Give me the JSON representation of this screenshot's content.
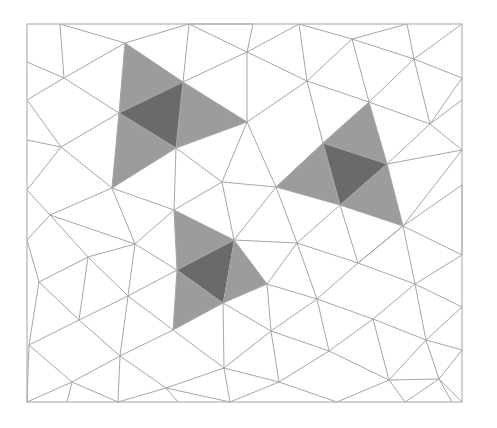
{
  "diagram": {
    "title": "",
    "type": "triangular-mesh",
    "colors": {
      "background": "#ffffff",
      "edge": "#a6a6a6",
      "frame": "#b3b3b3",
      "shade_light": "#9c9c9c",
      "shade_dark": "#6a6a6a"
    },
    "frame": {
      "x": 27,
      "y": 24,
      "w": 435,
      "h": 378
    },
    "vertices": {
      "A": [
        27,
        24
      ],
      "B": [
        60,
        24
      ],
      "C": [
        189,
        24
      ],
      "D": [
        253,
        24
      ],
      "E": [
        299,
        24
      ],
      "F": [
        407,
        24
      ],
      "G": [
        462,
        24
      ],
      "H": [
        27,
        62
      ],
      "I": [
        64,
        78
      ],
      "J": [
        125,
        43
      ],
      "K": [
        183,
        82
      ],
      "L": [
        247,
        52
      ],
      "M": [
        307,
        81
      ],
      "N": [
        352,
        39
      ],
      "O": [
        414,
        59
      ],
      "P": [
        462,
        78
      ],
      "Q": [
        27,
        100
      ],
      "R": [
        119,
        113
      ],
      "S": [
        247,
        122
      ],
      "T": [
        369,
        102
      ],
      "U": [
        430,
        124
      ],
      "V": [
        462,
        100
      ],
      "W": [
        27,
        140
      ],
      "X": [
        61,
        147
      ],
      "Y": [
        176,
        148
      ],
      "Z": [
        323,
        143
      ],
      "AA": [
        387,
        164
      ],
      "AB": [
        462,
        150
      ],
      "AC": [
        27,
        190
      ],
      "AD": [
        112,
        188
      ],
      "AE": [
        222,
        182
      ],
      "AF": [
        276,
        187
      ],
      "AG": [
        340,
        205
      ],
      "AH": [
        403,
        226
      ],
      "AI": [
        462,
        185
      ],
      "AJ": [
        50,
        215
      ],
      "AK": [
        174,
        210
      ],
      "AL": [
        234,
        240
      ],
      "AM": [
        297,
        243
      ],
      "AN": [
        358,
        263
      ],
      "AO": [
        462,
        255
      ],
      "AP": [
        27,
        240
      ],
      "AQ": [
        135,
        244
      ],
      "AR": [
        88,
        257
      ],
      "AS": [
        177,
        270
      ],
      "AT": [
        267,
        284
      ],
      "AU": [
        223,
        303
      ],
      "AV": [
        317,
        299
      ],
      "AW": [
        415,
        284
      ],
      "AX": [
        462,
        307
      ],
      "AY": [
        39,
        282
      ],
      "AZ": [
        128,
        296
      ],
      "BA": [
        79,
        320
      ],
      "BB": [
        173,
        330
      ],
      "BC": [
        271,
        331
      ],
      "BD": [
        373,
        319
      ],
      "BE": [
        426,
        340
      ],
      "BF": [
        29,
        345
      ],
      "BG": [
        120,
        356
      ],
      "BH": [
        224,
        368
      ],
      "BI": [
        329,
        351
      ],
      "BJ": [
        462,
        350
      ],
      "BK": [
        72,
        382
      ],
      "BL": [
        166,
        388
      ],
      "BM": [
        279,
        382
      ],
      "BN": [
        389,
        380
      ],
      "BO": [
        439,
        379
      ],
      "BP": [
        27,
        402
      ],
      "BQ": [
        67,
        402
      ],
      "BR": [
        118,
        402
      ],
      "BS": [
        178,
        402
      ],
      "BT": [
        230,
        402
      ],
      "BU": [
        337,
        402
      ],
      "BV": [
        405,
        402
      ],
      "BW": [
        452,
        402
      ],
      "BX": [
        462,
        402
      ]
    },
    "shaded_groups": [
      {
        "name": "cluster-top-left",
        "triangles": [
          {
            "pts": [
              "J",
              "K",
              "R"
            ],
            "shade": "light"
          },
          {
            "pts": [
              "K",
              "R",
              "Y"
            ],
            "shade": "dark"
          },
          {
            "pts": [
              "K",
              "S",
              "Y"
            ],
            "shade": "light"
          },
          {
            "pts": [
              "R",
              "Y",
              "AD"
            ],
            "shade": "light"
          }
        ]
      },
      {
        "name": "cluster-right",
        "triangles": [
          {
            "pts": [
              "T",
              "Z",
              "AA"
            ],
            "shade": "light"
          },
          {
            "pts": [
              "Z",
              "AA",
              "AG"
            ],
            "shade": "dark"
          },
          {
            "pts": [
              "Z",
              "AF",
              "AG"
            ],
            "shade": "light"
          },
          {
            "pts": [
              "AA",
              "AG",
              "AH"
            ],
            "shade": "light"
          }
        ]
      },
      {
        "name": "cluster-bottom",
        "triangles": [
          {
            "pts": [
              "AK",
              "AL",
              "AS"
            ],
            "shade": "light"
          },
          {
            "pts": [
              "AL",
              "AS",
              "AU"
            ],
            "shade": "dark"
          },
          {
            "pts": [
              "AL",
              "AT",
              "AU"
            ],
            "shade": "light"
          },
          {
            "pts": [
              "AS",
              "AU",
              "BB"
            ],
            "shade": "light"
          }
        ]
      }
    ],
    "edges": [
      [
        "B",
        "I"
      ],
      [
        "I",
        "J"
      ],
      [
        "J",
        "C"
      ],
      [
        "C",
        "K"
      ],
      [
        "B",
        "J"
      ],
      [
        "C",
        "L"
      ],
      [
        "C",
        "D"
      ],
      [
        "D",
        "L"
      ],
      [
        "L",
        "E"
      ],
      [
        "E",
        "N"
      ],
      [
        "N",
        "F"
      ],
      [
        "F",
        "O"
      ],
      [
        "O",
        "G"
      ],
      [
        "N",
        "O"
      ],
      [
        "H",
        "I"
      ],
      [
        "I",
        "Q"
      ],
      [
        "I",
        "R"
      ],
      [
        "J",
        "K"
      ],
      [
        "K",
        "L"
      ],
      [
        "K",
        "S"
      ],
      [
        "L",
        "S"
      ],
      [
        "L",
        "M"
      ],
      [
        "E",
        "M"
      ],
      [
        "M",
        "N"
      ],
      [
        "N",
        "T"
      ],
      [
        "O",
        "T"
      ],
      [
        "O",
        "U"
      ],
      [
        "O",
        "P"
      ],
      [
        "P",
        "U"
      ],
      [
        "Q",
        "X"
      ],
      [
        "R",
        "X"
      ],
      [
        "X",
        "W"
      ],
      [
        "R",
        "J"
      ],
      [
        "R",
        "K"
      ],
      [
        "R",
        "Y"
      ],
      [
        "K",
        "Y"
      ],
      [
        "S",
        "Y"
      ],
      [
        "S",
        "M"
      ],
      [
        "M",
        "T"
      ],
      [
        "M",
        "Z"
      ],
      [
        "T",
        "Z"
      ],
      [
        "T",
        "AA"
      ],
      [
        "T",
        "U"
      ],
      [
        "U",
        "AA"
      ],
      [
        "U",
        "V"
      ],
      [
        "U",
        "AB"
      ],
      [
        "X",
        "AC"
      ],
      [
        "X",
        "AD"
      ],
      [
        "R",
        "AD"
      ],
      [
        "Y",
        "AD"
      ],
      [
        "Y",
        "AE"
      ],
      [
        "S",
        "AE"
      ],
      [
        "S",
        "AF"
      ],
      [
        "AE",
        "AF"
      ],
      [
        "Z",
        "AF"
      ],
      [
        "Z",
        "AA"
      ],
      [
        "Z",
        "AG"
      ],
      [
        "AA",
        "AG"
      ],
      [
        "AA",
        "AH"
      ],
      [
        "AA",
        "AB"
      ],
      [
        "AB",
        "AH"
      ],
      [
        "AH",
        "AI"
      ],
      [
        "AC",
        "AJ"
      ],
      [
        "AD",
        "AJ"
      ],
      [
        "AD",
        "AK"
      ],
      [
        "Y",
        "AK"
      ],
      [
        "AE",
        "AK"
      ],
      [
        "AE",
        "AL"
      ],
      [
        "AF",
        "AL"
      ],
      [
        "AF",
        "AM"
      ],
      [
        "AF",
        "AG"
      ],
      [
        "AG",
        "AM"
      ],
      [
        "AG",
        "AN"
      ],
      [
        "AG",
        "AH"
      ],
      [
        "AH",
        "AN"
      ],
      [
        "AH",
        "AO"
      ],
      [
        "AI",
        "AO"
      ],
      [
        "AJ",
        "AP"
      ],
      [
        "AJ",
        "AR"
      ],
      [
        "AJ",
        "AQ"
      ],
      [
        "AD",
        "AQ"
      ],
      [
        "AK",
        "AQ"
      ],
      [
        "AK",
        "AS"
      ],
      [
        "AK",
        "AL"
      ],
      [
        "AL",
        "AS"
      ],
      [
        "AL",
        "AT"
      ],
      [
        "AL",
        "AM"
      ],
      [
        "AM",
        "AT"
      ],
      [
        "AM",
        "AV"
      ],
      [
        "AM",
        "AN"
      ],
      [
        "AN",
        "AV"
      ],
      [
        "AN",
        "AW"
      ],
      [
        "AN",
        "AH"
      ],
      [
        "AH",
        "AW"
      ],
      [
        "AW",
        "AO"
      ],
      [
        "AW",
        "AX"
      ],
      [
        "AP",
        "AY"
      ],
      [
        "AR",
        "AY"
      ],
      [
        "AR",
        "AQ"
      ],
      [
        "AR",
        "BA"
      ],
      [
        "AR",
        "AZ"
      ],
      [
        "AQ",
        "AZ"
      ],
      [
        "AQ",
        "AS"
      ],
      [
        "AS",
        "AZ"
      ],
      [
        "AS",
        "AU"
      ],
      [
        "AS",
        "BB"
      ],
      [
        "AU",
        "AT"
      ],
      [
        "AU",
        "BB"
      ],
      [
        "AU",
        "BH"
      ],
      [
        "AU",
        "BC"
      ],
      [
        "AT",
        "BC"
      ],
      [
        "AT",
        "AV"
      ],
      [
        "AV",
        "BC"
      ],
      [
        "AV",
        "BD"
      ],
      [
        "AV",
        "BI"
      ],
      [
        "AW",
        "BD"
      ],
      [
        "AW",
        "BE"
      ],
      [
        "AX",
        "BE"
      ],
      [
        "BD",
        "BE"
      ],
      [
        "AY",
        "BA"
      ],
      [
        "AY",
        "BF"
      ],
      [
        "BA",
        "AZ"
      ],
      [
        "BA",
        "BF"
      ],
      [
        "BA",
        "BG"
      ],
      [
        "AZ",
        "BB"
      ],
      [
        "AZ",
        "BG"
      ],
      [
        "BB",
        "BG"
      ],
      [
        "BB",
        "BH"
      ],
      [
        "BC",
        "BH"
      ],
      [
        "BC",
        "BI"
      ],
      [
        "BC",
        "BM"
      ],
      [
        "BI",
        "BD"
      ],
      [
        "BI",
        "BN"
      ],
      [
        "BD",
        "BN"
      ],
      [
        "BE",
        "BN"
      ],
      [
        "BE",
        "BJ"
      ],
      [
        "BE",
        "BO"
      ],
      [
        "BJ",
        "BO"
      ],
      [
        "BF",
        "BK"
      ],
      [
        "BF",
        "BP"
      ],
      [
        "BG",
        "BK"
      ],
      [
        "BG",
        "BL"
      ],
      [
        "BH",
        "BL"
      ],
      [
        "BH",
        "BM"
      ],
      [
        "BG",
        "BR"
      ],
      [
        "BK",
        "BR"
      ],
      [
        "BK",
        "BP"
      ],
      [
        "BK",
        "BQ"
      ],
      [
        "BL",
        "BR"
      ],
      [
        "BL",
        "BS"
      ],
      [
        "BL",
        "BT"
      ],
      [
        "BH",
        "BT"
      ],
      [
        "BM",
        "BT"
      ],
      [
        "BM",
        "BU"
      ],
      [
        "BI",
        "BM"
      ],
      [
        "BN",
        "BU"
      ],
      [
        "BN",
        "BV"
      ],
      [
        "BN",
        "BO"
      ],
      [
        "BO",
        "BW"
      ],
      [
        "BO",
        "BX"
      ],
      [
        "BO",
        "BV"
      ]
    ]
  }
}
